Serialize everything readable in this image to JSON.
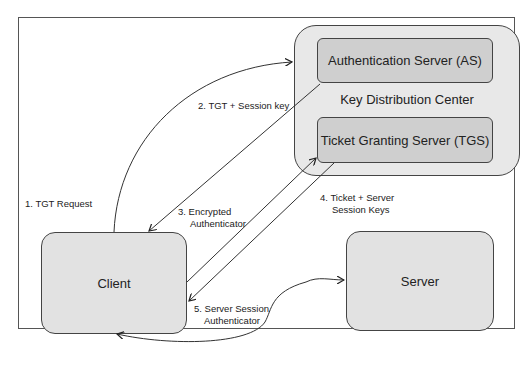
{
  "diagram": {
    "nodes": {
      "kdc": "Key Distribution Center",
      "as": "Authentication Server (AS)",
      "tgs": "Ticket Granting Server (TGS)",
      "client": "Client",
      "server": "Server"
    },
    "edges": [
      {
        "id": "1",
        "label": "1. TGT Request",
        "from": "client",
        "to": "as"
      },
      {
        "id": "2",
        "label": "2. TGT + Session key",
        "from": "as",
        "to": "client"
      },
      {
        "id": "3",
        "label_line1": "3. Encrypted",
        "label_line2": "Authenticator",
        "from": "client",
        "to": "tgs"
      },
      {
        "id": "4",
        "label_line1": "4. Ticket + Server",
        "label_line2": "Session Keys",
        "from": "tgs",
        "to": "client"
      },
      {
        "id": "5",
        "label_line1": "5. Server Session",
        "label_line2": "Authenticator",
        "from": "client",
        "to": "server"
      }
    ],
    "colors": {
      "kdc_fill": "#e8e8e8",
      "server_fill": "#cfcfcf",
      "node_fill": "#e2e2e2",
      "stroke": "#444444"
    }
  }
}
